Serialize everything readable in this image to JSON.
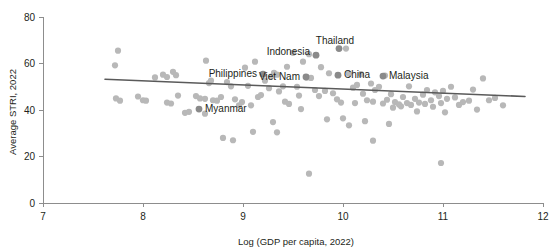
{
  "chart_data": {
    "type": "scatter",
    "title": "",
    "subtitle": "",
    "xlabel": "Log (GDP per capita, 2022)",
    "ylabel": "Average STRI, 2022",
    "xlim": [
      7,
      12
    ],
    "ylim": [
      0,
      80
    ],
    "xticks": [
      7,
      8,
      9,
      10,
      11,
      12
    ],
    "yticks": [
      0,
      20,
      40,
      60,
      80
    ],
    "xtick_labels": [
      "7",
      "8",
      "9",
      "10",
      "11",
      "12"
    ],
    "ytick_labels": [
      "0",
      "20",
      "40",
      "60",
      "80"
    ],
    "grid": false,
    "legend": false,
    "legend_position": "none",
    "colors": {
      "point": "#b8b8b8",
      "highlight_point": "#8a8a8a",
      "trend_line": "#5a5a5a",
      "axis": "#8d8d8d",
      "text": "#231f20",
      "background": "#ffffff"
    },
    "point_radius": 3.1,
    "highlight_point_radius": 3.4,
    "trend_line": {
      "x": [
        7.62,
        11.82
      ],
      "y": [
        53.2,
        45.8
      ],
      "slope": -1.76,
      "intercept": 66.6
    },
    "annotations": [
      {
        "label": "Philippines",
        "x": 9.2,
        "y": 55.4,
        "label_dx": -6,
        "label_dy": 3,
        "anchor": "end"
      },
      {
        "label": "Indonesia",
        "x": 9.73,
        "y": 63.6,
        "label_dx": -6,
        "label_dy": 0,
        "anchor": "end"
      },
      {
        "label": "Thailand",
        "x": 9.96,
        "y": 66.4,
        "label_dx": -4,
        "label_dy": -5,
        "anchor": "middle"
      },
      {
        "label": "Viet Nam",
        "x": 9.63,
        "y": 54.2,
        "label_dx": -6,
        "label_dy": 3,
        "anchor": "end"
      },
      {
        "label": "China",
        "x": 9.95,
        "y": 55.0,
        "label_dx": 6,
        "label_dy": 3,
        "anchor": "start"
      },
      {
        "label": "Malaysia",
        "x": 10.4,
        "y": 54.6,
        "label_dx": 6,
        "label_dy": 3,
        "anchor": "start"
      },
      {
        "label": "Myanmar",
        "x": 8.56,
        "y": 40.4,
        "label_dx": 6,
        "label_dy": 3,
        "anchor": "start"
      }
    ],
    "points": [
      {
        "x": 7.75,
        "y": 65.5
      },
      {
        "x": 7.72,
        "y": 59.2
      },
      {
        "x": 7.73,
        "y": 45.0
      },
      {
        "x": 7.77,
        "y": 44.0
      },
      {
        "x": 7.95,
        "y": 45.8
      },
      {
        "x": 8.0,
        "y": 44.2
      },
      {
        "x": 8.03,
        "y": 44.0
      },
      {
        "x": 8.12,
        "y": 54.0
      },
      {
        "x": 8.2,
        "y": 55.2
      },
      {
        "x": 8.24,
        "y": 54.2
      },
      {
        "x": 8.3,
        "y": 56.4
      },
      {
        "x": 8.33,
        "y": 55.0
      },
      {
        "x": 8.24,
        "y": 43.2
      },
      {
        "x": 8.28,
        "y": 42.8
      },
      {
        "x": 8.35,
        "y": 46.2
      },
      {
        "x": 8.42,
        "y": 38.8
      },
      {
        "x": 8.46,
        "y": 39.2
      },
      {
        "x": 8.53,
        "y": 46.0
      },
      {
        "x": 8.57,
        "y": 45.0
      },
      {
        "x": 8.62,
        "y": 44.8
      },
      {
        "x": 8.66,
        "y": 51.6
      },
      {
        "x": 8.68,
        "y": 52.6
      },
      {
        "x": 8.63,
        "y": 61.2
      },
      {
        "x": 8.7,
        "y": 44.2
      },
      {
        "x": 8.74,
        "y": 44.0
      },
      {
        "x": 8.78,
        "y": 45.6
      },
      {
        "x": 8.8,
        "y": 28.0
      },
      {
        "x": 8.84,
        "y": 52.0
      },
      {
        "x": 8.88,
        "y": 50.2
      },
      {
        "x": 8.92,
        "y": 44.6
      },
      {
        "x": 8.9,
        "y": 27.0
      },
      {
        "x": 8.96,
        "y": 42.0
      },
      {
        "x": 8.99,
        "y": 43.4
      },
      {
        "x": 9.02,
        "y": 58.2
      },
      {
        "x": 9.05,
        "y": 50.4
      },
      {
        "x": 9.08,
        "y": 42.0
      },
      {
        "x": 9.12,
        "y": 60.8
      },
      {
        "x": 9.1,
        "y": 30.6
      },
      {
        "x": 9.15,
        "y": 45.6
      },
      {
        "x": 9.18,
        "y": 46.4
      },
      {
        "x": 9.22,
        "y": 52.6
      },
      {
        "x": 9.26,
        "y": 49.4
      },
      {
        "x": 9.28,
        "y": 54.4
      },
      {
        "x": 9.31,
        "y": 56.0
      },
      {
        "x": 9.34,
        "y": 55.2
      },
      {
        "x": 9.3,
        "y": 34.8
      },
      {
        "x": 9.36,
        "y": 48.0
      },
      {
        "x": 9.4,
        "y": 50.2
      },
      {
        "x": 9.44,
        "y": 58.6
      },
      {
        "x": 9.42,
        "y": 43.6
      },
      {
        "x": 9.46,
        "y": 42.6
      },
      {
        "x": 9.5,
        "y": 64.6
      },
      {
        "x": 9.54,
        "y": 50.0
      },
      {
        "x": 9.56,
        "y": 46.2
      },
      {
        "x": 9.6,
        "y": 60.8
      },
      {
        "x": 9.58,
        "y": 40.4
      },
      {
        "x": 9.64,
        "y": 54.0
      },
      {
        "x": 9.68,
        "y": 53.8
      },
      {
        "x": 9.66,
        "y": 64.0
      },
      {
        "x": 9.72,
        "y": 48.6
      },
      {
        "x": 9.76,
        "y": 46.0
      },
      {
        "x": 9.78,
        "y": 58.4
      },
      {
        "x": 9.82,
        "y": 48.2
      },
      {
        "x": 9.86,
        "y": 55.8
      },
      {
        "x": 9.84,
        "y": 36.0
      },
      {
        "x": 9.9,
        "y": 47.2
      },
      {
        "x": 9.94,
        "y": 44.6
      },
      {
        "x": 9.98,
        "y": 43.2
      },
      {
        "x": 10.03,
        "y": 66.4
      },
      {
        "x": 10.0,
        "y": 36.4
      },
      {
        "x": 10.06,
        "y": 55.6
      },
      {
        "x": 10.1,
        "y": 49.6
      },
      {
        "x": 10.14,
        "y": 50.8
      },
      {
        "x": 10.12,
        "y": 43.0
      },
      {
        "x": 10.18,
        "y": 55.4
      },
      {
        "x": 10.2,
        "y": 47.0
      },
      {
        "x": 10.24,
        "y": 44.2
      },
      {
        "x": 10.22,
        "y": 35.2
      },
      {
        "x": 10.28,
        "y": 51.4
      },
      {
        "x": 10.32,
        "y": 48.6
      },
      {
        "x": 10.3,
        "y": 43.6
      },
      {
        "x": 10.36,
        "y": 50.0
      },
      {
        "x": 10.4,
        "y": 42.8
      },
      {
        "x": 10.44,
        "y": 44.4
      },
      {
        "x": 10.42,
        "y": 54.8
      },
      {
        "x": 10.48,
        "y": 46.8
      },
      {
        "x": 10.52,
        "y": 43.4
      },
      {
        "x": 10.5,
        "y": 41.0
      },
      {
        "x": 10.56,
        "y": 42.4
      },
      {
        "x": 10.6,
        "y": 45.6
      },
      {
        "x": 10.58,
        "y": 41.6
      },
      {
        "x": 10.64,
        "y": 43.0
      },
      {
        "x": 10.68,
        "y": 42.2
      },
      {
        "x": 10.66,
        "y": 50.2
      },
      {
        "x": 10.72,
        "y": 44.8
      },
      {
        "x": 10.76,
        "y": 43.2
      },
      {
        "x": 10.74,
        "y": 39.4
      },
      {
        "x": 10.8,
        "y": 46.6
      },
      {
        "x": 10.84,
        "y": 48.6
      },
      {
        "x": 10.82,
        "y": 42.6
      },
      {
        "x": 10.88,
        "y": 44.2
      },
      {
        "x": 10.92,
        "y": 47.6
      },
      {
        "x": 10.9,
        "y": 41.4
      },
      {
        "x": 10.96,
        "y": 46.0
      },
      {
        "x": 11.0,
        "y": 48.2
      },
      {
        "x": 10.98,
        "y": 43.0
      },
      {
        "x": 11.04,
        "y": 44.8
      },
      {
        "x": 11.02,
        "y": 39.0
      },
      {
        "x": 11.08,
        "y": 50.0
      },
      {
        "x": 11.12,
        "y": 45.4
      },
      {
        "x": 11.16,
        "y": 42.2
      },
      {
        "x": 11.2,
        "y": 43.4
      },
      {
        "x": 11.26,
        "y": 44.0
      },
      {
        "x": 11.3,
        "y": 48.8
      },
      {
        "x": 11.34,
        "y": 40.2
      },
      {
        "x": 11.4,
        "y": 53.6
      },
      {
        "x": 11.46,
        "y": 44.2
      },
      {
        "x": 11.52,
        "y": 45.2
      },
      {
        "x": 11.6,
        "y": 42.0
      },
      {
        "x": 10.98,
        "y": 17.2
      },
      {
        "x": 9.66,
        "y": 12.6
      },
      {
        "x": 10.3,
        "y": 26.8
      },
      {
        "x": 10.46,
        "y": 34.0
      },
      {
        "x": 10.06,
        "y": 33.4
      },
      {
        "x": 9.34,
        "y": 30.4
      },
      {
        "x": 8.62,
        "y": 38.4
      },
      {
        "x": 9.2,
        "y": 55.4
      },
      {
        "x": 9.73,
        "y": 63.6
      },
      {
        "x": 9.96,
        "y": 66.4
      },
      {
        "x": 9.63,
        "y": 54.2
      },
      {
        "x": 9.95,
        "y": 55.0
      },
      {
        "x": 10.4,
        "y": 54.6
      },
      {
        "x": 8.56,
        "y": 40.4
      }
    ],
    "highlight_indices": [
      126,
      127,
      128,
      129,
      130,
      131,
      132
    ]
  }
}
